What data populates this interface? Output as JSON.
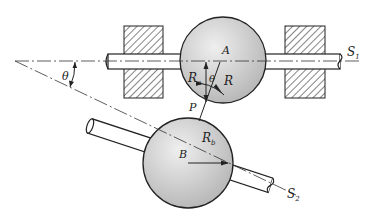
{
  "diagram": {
    "labels": {
      "theta_left": "θ",
      "theta_center": "θ",
      "A": "A",
      "B": "B",
      "P": "P",
      "R": "R",
      "Ra_main": "R",
      "Ra_sub": "a",
      "Rb_main": "R",
      "Rb_sub": "b",
      "S1_main": "S",
      "S1_sub": "1",
      "S2_main": "S",
      "S2_sub": "2"
    },
    "colors": {
      "sphere_fill_light": "#e6e6e6",
      "sphere_fill_dark": "#b9b9b9",
      "stroke": "#222222",
      "hatch": "#333333"
    }
  }
}
